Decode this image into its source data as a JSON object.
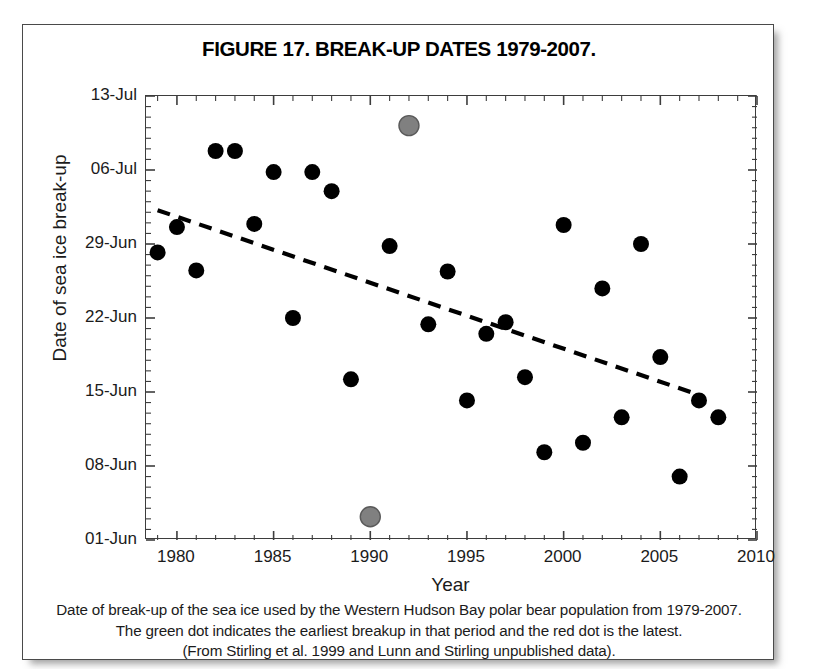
{
  "figure": {
    "title": "FIGURE 17. BREAK-UP DATES 1979-2007.",
    "caption_lines": [
      "Date of break-up of the sea ice used by the Western Hudson Bay polar bear population from 1979-2007.",
      "The green dot indicates the earliest breakup in that period and the red dot is the latest.",
      "(From Stirling et al. 1999 and Lunn and Stirling unpublished data)."
    ]
  },
  "chart_data": {
    "type": "scatter",
    "title": "FIGURE 17. BREAK-UP DATES 1979-2007.",
    "xlabel": "Year",
    "ylabel": "Date of sea ice break-up",
    "xlim": [
      1978.4,
      2010.0
    ],
    "ylim": [
      0,
      42
    ],
    "xticks": [
      1980,
      1985,
      1990,
      1995,
      2000,
      2005,
      2010
    ],
    "xtick_labels": [
      "1980",
      "1985",
      "1990",
      "1995",
      "2000",
      "2005",
      "2010"
    ],
    "yticks": [
      0,
      7,
      14,
      21,
      28,
      35,
      42
    ],
    "ytick_labels": [
      "01-Jun",
      "08-Jun",
      "15-Jun",
      "22-Jun",
      "29-Jun",
      "06-Jul",
      "13-Jul"
    ],
    "y_unit_note": "y value = days after 01-Jun",
    "grid": false,
    "legend": null,
    "minor_ticks_y": 1,
    "minor_ticks_x": 1,
    "series": [
      {
        "name": "Break-up date",
        "marker": "filled-circle",
        "color": "#000000",
        "points": [
          {
            "year": 1979,
            "day": 27.2,
            "label": "28-Jun"
          },
          {
            "year": 1980,
            "day": 29.6,
            "label": "30-Jun"
          },
          {
            "year": 1981,
            "day": 25.5,
            "label": "26-Jun"
          },
          {
            "year": 1982,
            "day": 36.8,
            "label": "07-Jul"
          },
          {
            "year": 1983,
            "day": 36.8,
            "label": "07-Jul"
          },
          {
            "year": 1984,
            "day": 29.9,
            "label": "30-Jun"
          },
          {
            "year": 1985,
            "day": 34.8,
            "label": "05-Jul"
          },
          {
            "year": 1986,
            "day": 21.0,
            "label": "22-Jun"
          },
          {
            "year": 1987,
            "day": 34.8,
            "label": "05-Jul"
          },
          {
            "year": 1988,
            "day": 33.0,
            "label": "04-Jul"
          },
          {
            "year": 1989,
            "day": 15.2,
            "label": "16-Jun"
          },
          {
            "year": 1991,
            "day": 27.8,
            "label": "28-Jun"
          },
          {
            "year": 1993,
            "day": 20.4,
            "label": "21-Jun"
          },
          {
            "year": 1994,
            "day": 25.4,
            "label": "26-Jun"
          },
          {
            "year": 1995,
            "day": 13.2,
            "label": "14-Jun"
          },
          {
            "year": 1996,
            "day": 19.5,
            "label": "20-Jun"
          },
          {
            "year": 1997,
            "day": 20.6,
            "label": "21-Jun"
          },
          {
            "year": 1998,
            "day": 15.4,
            "label": "16-Jun"
          },
          {
            "year": 1999,
            "day": 8.3,
            "label": "09-Jun"
          },
          {
            "year": 2000,
            "day": 29.8,
            "label": "30-Jun"
          },
          {
            "year": 2001,
            "day": 9.2,
            "label": "10-Jun"
          },
          {
            "year": 2002,
            "day": 23.8,
            "label": "24-Jun"
          },
          {
            "year": 2003,
            "day": 11.6,
            "label": "12-Jun"
          },
          {
            "year": 2004,
            "day": 28.0,
            "label": "29-Jun"
          },
          {
            "year": 2005,
            "day": 17.3,
            "label": "18-Jun"
          },
          {
            "year": 2006,
            "day": 6.0,
            "label": "07-Jun"
          },
          {
            "year": 2007,
            "day": 13.2,
            "label": "14-Jun"
          },
          {
            "year": 2008,
            "day": 11.6,
            "label": "12-Jun"
          }
        ]
      },
      {
        "name": "Earliest / latest break-up highlights",
        "marker": "filled-circle-gray",
        "color": "#808080",
        "points": [
          {
            "year": 1992,
            "day": 39.2,
            "label": "10-Jul",
            "role": "latest"
          },
          {
            "year": 1990,
            "day": 2.2,
            "label": "03-Jun",
            "role": "earliest"
          }
        ]
      }
    ],
    "trendline": {
      "style": "dashed",
      "color": "#000000",
      "x_start": 1979.0,
      "y_start": 31.2,
      "x_end": 2007.2,
      "y_end": 13.6
    }
  }
}
